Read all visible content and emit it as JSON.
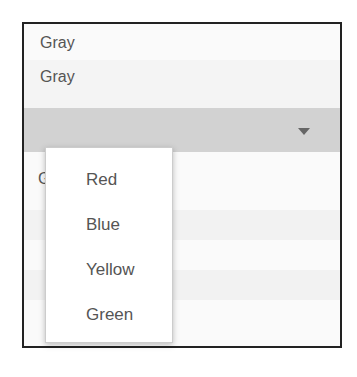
{
  "rows": [
    {
      "label": "Gray"
    },
    {
      "label": "Gray"
    }
  ],
  "select": {
    "value": "",
    "icon": "caret-down-icon"
  },
  "obscured_label": "G",
  "menu": {
    "items": [
      {
        "label": "Red"
      },
      {
        "label": "Blue"
      },
      {
        "label": "Yellow"
      },
      {
        "label": "Green"
      }
    ]
  },
  "colors": {
    "frame_border": "#222222",
    "select_bar": "#d2d2d2",
    "text": "#555555",
    "popup_bg": "#ffffff"
  }
}
